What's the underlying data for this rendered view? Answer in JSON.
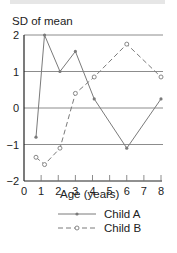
{
  "chart_data": {
    "type": "line",
    "title": "",
    "ylabel": "SD of mean",
    "xlabel": "Age (years)",
    "xlim": [
      0,
      8
    ],
    "ylim": [
      -2,
      2
    ],
    "x_ticks": [
      0,
      1,
      2,
      3,
      4,
      5,
      6,
      7,
      8
    ],
    "y_ticks": [
      2,
      1,
      0,
      -1,
      -2
    ],
    "x_tick_labels": [
      "0",
      "1",
      "2",
      "3",
      "4",
      "5",
      "6",
      "7",
      "8"
    ],
    "y_tick_labels": [
      "2",
      "1",
      "0",
      "−1",
      "−2"
    ],
    "grid": "horizontal lines at y = 2, 1, 0, -1",
    "legend_position": "below x-axis label",
    "series": [
      {
        "name": "Child A",
        "style": "solid line, filled dot markers",
        "x": [
          0.7,
          1.2,
          2.1,
          3.0,
          4.1,
          6.0,
          8.0
        ],
        "y": [
          -0.8,
          2.0,
          1.0,
          1.55,
          0.25,
          -1.1,
          0.25
        ]
      },
      {
        "name": "Child B",
        "style": "dashed line, open circle markers",
        "x": [
          0.7,
          1.2,
          2.1,
          3.0,
          4.1,
          6.0,
          8.0
        ],
        "y": [
          -1.35,
          -1.55,
          -1.1,
          0.4,
          0.85,
          1.75,
          0.85
        ]
      }
    ]
  },
  "colors": {
    "line": "#7a7a7a",
    "axis": "#222222",
    "grid": "#6e6e6e",
    "text": "#222222"
  }
}
